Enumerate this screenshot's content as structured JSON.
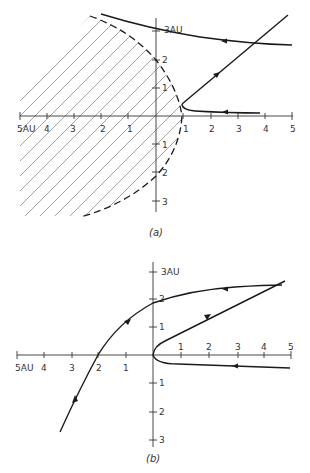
{
  "figure_a": {
    "caption": "(a)",
    "x_labels": {
      "neg5": "5AU",
      "neg4": "4",
      "neg3": "3",
      "neg2": "2",
      "neg1": "1",
      "pos1": "1",
      "pos2": "2",
      "pos3": "3",
      "pos4": "4",
      "pos5": "5"
    },
    "y_labels": {
      "pos3": "3AU",
      "pos2": "2",
      "pos1": "1",
      "neg1": "1",
      "neg2": "2",
      "neg3": "3"
    },
    "elements": [
      "hatched forbidden region",
      "dashed parabolic boundary",
      "incoming trajectory from right",
      "outgoing straight trajectory",
      "top trajectory heading left"
    ]
  },
  "figure_b": {
    "caption": "(b)",
    "x_labels": {
      "neg5": "5AU",
      "neg4": "4",
      "neg3": "3",
      "neg2": "2",
      "neg1": "1",
      "pos1": "1",
      "pos2": "2",
      "pos3": "3",
      "pos4": "4",
      "pos5": "5"
    },
    "y_labels": {
      "pos3": "3AU",
      "pos2": "2",
      "pos1": "1",
      "neg1": "1",
      "neg2": "2",
      "neg3": "3"
    },
    "elements": [
      "incoming trajectory from right",
      "outgoing straight trajectory",
      "large curved trajectory sweeping left and down"
    ]
  }
}
